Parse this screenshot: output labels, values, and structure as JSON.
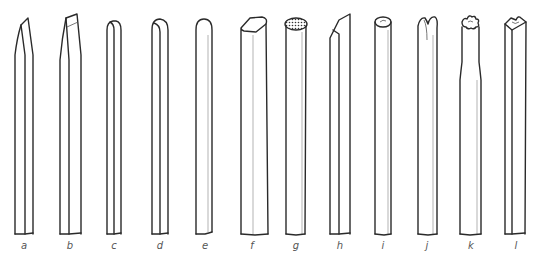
{
  "figure": {
    "items": [
      {
        "label": "a",
        "shape": "chisel-taper"
      },
      {
        "label": "b",
        "shape": "angled-chisel"
      },
      {
        "label": "c",
        "shape": "rounded-flat"
      },
      {
        "label": "d",
        "shape": "rounded"
      },
      {
        "label": "e",
        "shape": "round-cylinder"
      },
      {
        "label": "f",
        "shape": "flat-oval-end"
      },
      {
        "label": "g",
        "shape": "hatched-oval-end"
      },
      {
        "label": "h",
        "shape": "angled-cut"
      },
      {
        "label": "i",
        "shape": "hollow-tube"
      },
      {
        "label": "j",
        "shape": "split-lobe"
      },
      {
        "label": "k",
        "shape": "star-section"
      },
      {
        "label": "l",
        "shape": "triangular-notched"
      }
    ]
  }
}
